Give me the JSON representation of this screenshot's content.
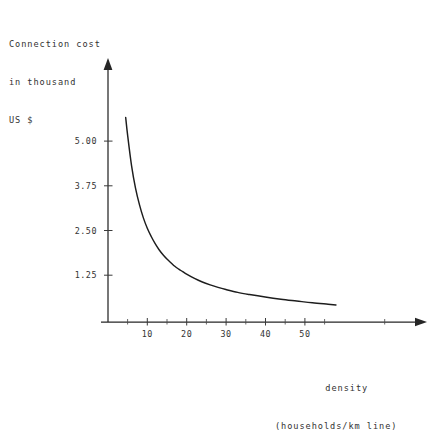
{
  "figure": {
    "cut_off_top_text": "         ",
    "background_color": "#ffffff",
    "ink_color": "#1d1d1d"
  },
  "chart_data": {
    "type": "line",
    "title": "",
    "ylabel": "Connection cost\nin thousand\nUS $",
    "ylabel_lines": [
      "Connection cost",
      "in thousand",
      "US $"
    ],
    "xlabel": "density\n(households/km line)",
    "xlabel_lines": [
      "density",
      "(households/km line)"
    ],
    "xlabel_line1": "density",
    "xlabel_line2": "(households/km line)",
    "xtick_labels": [
      "10",
      "20",
      "30",
      "40",
      "50"
    ],
    "xtick_values": [
      10,
      20,
      30,
      40,
      50
    ],
    "xtick_minor_values": [
      5,
      15,
      25,
      35,
      45,
      55
    ],
    "ytick_labels": [
      "1.25",
      "2.50",
      "3.75",
      "5.00"
    ],
    "ytick_values": [
      1.25,
      2.5,
      3.75,
      5.0
    ],
    "xlim": [
      0,
      61
    ],
    "ylim": [
      0,
      6.3
    ],
    "grid": false,
    "legend": false,
    "series": [
      {
        "name": "connection cost",
        "x": [
          4.5,
          5,
          6,
          7,
          8,
          9,
          10,
          11,
          12,
          13,
          14,
          15,
          16,
          17,
          18,
          19,
          20,
          22,
          24,
          26,
          28,
          30,
          33,
          36,
          40,
          44,
          48,
          52,
          56,
          58
        ],
        "y": [
          5.65,
          5.15,
          4.3,
          3.68,
          3.22,
          2.85,
          2.56,
          2.33,
          2.13,
          1.96,
          1.82,
          1.7,
          1.6,
          1.5,
          1.42,
          1.35,
          1.28,
          1.16,
          1.06,
          0.98,
          0.91,
          0.85,
          0.77,
          0.71,
          0.64,
          0.58,
          0.53,
          0.48,
          0.44,
          0.42
        ]
      }
    ]
  }
}
